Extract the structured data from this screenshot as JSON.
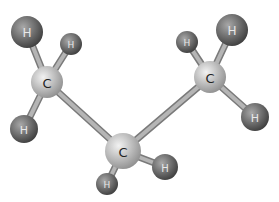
{
  "diagram": {
    "type": "ball-and-stick molecular model",
    "molecule": "propane",
    "colors": {
      "background": "#ffffff",
      "bond": "#b5b5b5",
      "bond_edge": "#7a7a7a",
      "carbon_light": "#f2f2f2",
      "carbon_dark": "#8e8e8e",
      "hydrogen_light": "#a8a8a8",
      "hydrogen_dark": "#3c3c3c",
      "label": "#222222"
    },
    "atoms": [
      {
        "id": "C1",
        "element": "C",
        "label": "C",
        "x": 47,
        "y": 82,
        "r": 16
      },
      {
        "id": "C2",
        "element": "C",
        "label": "C",
        "x": 123,
        "y": 151,
        "r": 18
      },
      {
        "id": "C3",
        "element": "C",
        "label": "C",
        "x": 210,
        "y": 77,
        "r": 16
      },
      {
        "id": "H1",
        "element": "H",
        "label": "H",
        "x": 27,
        "y": 32,
        "r": 16
      },
      {
        "id": "H2",
        "element": "H",
        "label": "H",
        "x": 71,
        "y": 44,
        "r": 11
      },
      {
        "id": "H3",
        "element": "H",
        "label": "H",
        "x": 24,
        "y": 129,
        "r": 14
      },
      {
        "id": "H4",
        "element": "H",
        "label": "H",
        "x": 107,
        "y": 184,
        "r": 11
      },
      {
        "id": "H5",
        "element": "H",
        "label": "H",
        "x": 165,
        "y": 167,
        "r": 13
      },
      {
        "id": "H6",
        "element": "H",
        "label": "H",
        "x": 187,
        "y": 42,
        "r": 11
      },
      {
        "id": "H7",
        "element": "H",
        "label": "H",
        "x": 232,
        "y": 30,
        "r": 16
      },
      {
        "id": "H8",
        "element": "H",
        "label": "H",
        "x": 255,
        "y": 117,
        "r": 14
      }
    ],
    "bonds": [
      [
        "C1",
        "C2"
      ],
      [
        "C2",
        "C3"
      ],
      [
        "C1",
        "H1"
      ],
      [
        "C1",
        "H2"
      ],
      [
        "C1",
        "H3"
      ],
      [
        "C2",
        "H4"
      ],
      [
        "C2",
        "H5"
      ],
      [
        "C3",
        "H6"
      ],
      [
        "C3",
        "H7"
      ],
      [
        "C3",
        "H8"
      ]
    ]
  }
}
